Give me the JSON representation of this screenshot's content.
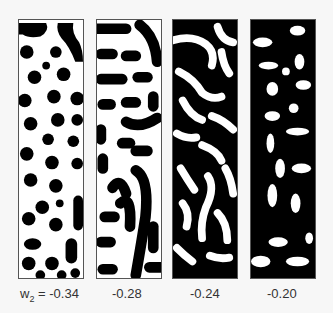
{
  "figure": {
    "parameter_symbol": "w",
    "parameter_subscript": "2",
    "equals": "=",
    "panels": [
      {
        "value": "-0.34",
        "pattern": "black spots on white"
      },
      {
        "value": "-0.28",
        "pattern": "black stripes/labyrinth on white"
      },
      {
        "value": "-0.24",
        "pattern": "mixed labyrinth"
      },
      {
        "value": "-0.20",
        "pattern": "white spots/stripes on black"
      }
    ]
  },
  "colors": {
    "foreground": "#000000",
    "background": "#ffffff",
    "border": "#555555"
  }
}
